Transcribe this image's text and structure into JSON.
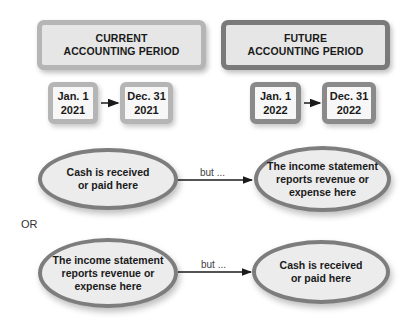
{
  "periods": {
    "current": {
      "label": "CURRENT\nACCOUNTING PERIOD"
    },
    "future": {
      "label": "FUTURE\nACCOUNTING PERIOD"
    }
  },
  "dates": {
    "current_start": "Jan. 1\n2021",
    "current_end": "Dec. 31\n2021",
    "future_start": "Jan. 1\n2022",
    "future_end": "Dec. 31\n2022"
  },
  "scenario_1": {
    "left": "Cash is received\nor paid here",
    "connector": "but ...",
    "right": "The income statement\nreports revenue or\nexpense here"
  },
  "separator": "OR",
  "scenario_2": {
    "left": "The income statement\nreports revenue or\nexpense here",
    "connector": "but ...",
    "right": "Cash is received\nor paid here"
  },
  "colors": {
    "current_border": "#b5b5b5",
    "future_border": "#7a7a7a",
    "ellipse_border": "#7d7d7d",
    "fill": "#e6e6e6"
  }
}
